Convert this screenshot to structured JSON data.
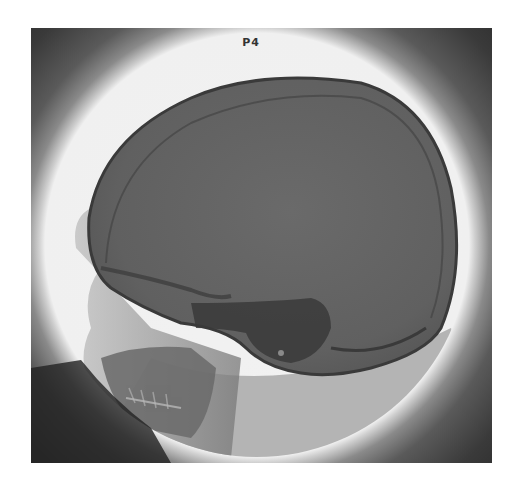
{
  "image": {
    "description": "Lateral skull X-ray radiograph within circular field of view",
    "label": "P4"
  },
  "colors": {
    "background": "#ffffff",
    "frame": "#2e2e2e",
    "field": "#f0f0f0",
    "skull": "#5f5f5f",
    "skull_dark": "#3e3e3e"
  }
}
